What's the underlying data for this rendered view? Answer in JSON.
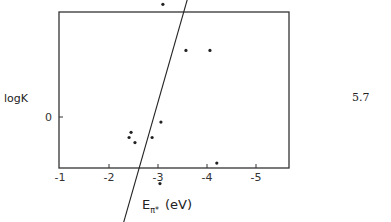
{
  "equation_number": "5.7",
  "chart_data": {
    "type": "scatter",
    "title": "",
    "xlabel": "E_π* (eV)",
    "xlabel_main": "E",
    "xlabel_sub": "π*",
    "xlabel_unit": "(eV)",
    "ylabel": "logK",
    "xlim": [
      -1,
      -5.7
    ],
    "ylim": [
      -5,
      10
    ],
    "x_ticks": [
      -1,
      -2,
      -3,
      -4,
      -5
    ],
    "x_tick_labels": [
      "-1",
      "-2",
      "-3",
      "-4",
      "-5"
    ],
    "y_ticks": [
      -5,
      0,
      5,
      10
    ],
    "y_tick_labels": [
      "-5",
      "0",
      "5",
      "10"
    ],
    "grid": false,
    "legend": null,
    "series": [
      {
        "name": "data",
        "points": [
          [
            -1.59,
            2.4
          ],
          [
            -1.63,
            -3.5
          ],
          [
            -2.14,
            -2.7
          ],
          [
            -2.22,
            -2.6
          ],
          [
            -2.41,
            -0.4
          ],
          [
            -2.45,
            -0.3
          ],
          [
            -2.53,
            -0.5
          ],
          [
            -2.45,
            -2.4
          ],
          [
            -2.49,
            -2.8
          ],
          [
            -2.88,
            -0.4
          ],
          [
            -3.06,
            -0.1
          ],
          [
            -3.04,
            -1.3
          ],
          [
            -3.1,
            2.2
          ],
          [
            -3.16,
            2.4
          ],
          [
            -3.57,
            1.3
          ],
          [
            -4.06,
            1.3
          ],
          [
            -4.12,
            3.6
          ],
          [
            -4.2,
            -0.9
          ],
          [
            -4.43,
            4.7
          ]
        ]
      }
    ],
    "fit_line": {
      "start": [
        -1.6,
        -4.4
      ],
      "end": [
        -5.45,
        8.5
      ]
    }
  }
}
